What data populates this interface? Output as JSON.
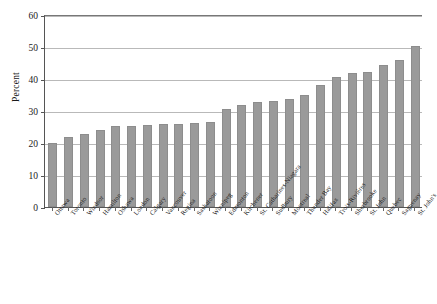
{
  "chart_data": {
    "type": "bar",
    "title": "",
    "xlabel": "",
    "ylabel": "Percent",
    "ylim": [
      0,
      60
    ],
    "yticks": [
      0,
      10,
      20,
      30,
      40,
      50,
      60
    ],
    "grid": true,
    "legend": null,
    "bar_color": "#9a9a9a",
    "categories": [
      "Ottawa",
      "Toronto",
      "Windsor",
      "Hamilton",
      "Oshawa",
      "London",
      "Calgary",
      "Vancouver",
      "Regina",
      "Saskatoon",
      "Winnipeg",
      "Edmonton",
      "Kitchener",
      "St. Catharines-Niagara",
      "Sudbury",
      "Montreal",
      "Thunder Bay",
      "Halifax",
      "Trois-Rivières",
      "Sherbrooke",
      "St. John",
      "Quebec",
      "Saguenay",
      "St. John's"
    ],
    "values": [
      20.0,
      22.0,
      22.8,
      24.2,
      25.4,
      25.4,
      25.5,
      26.0,
      26.0,
      26.1,
      26.7,
      30.5,
      31.8,
      32.9,
      33.0,
      33.7,
      35.0,
      38.0,
      40.6,
      42.0,
      42.3,
      44.3,
      46.0,
      50.3
    ]
  }
}
